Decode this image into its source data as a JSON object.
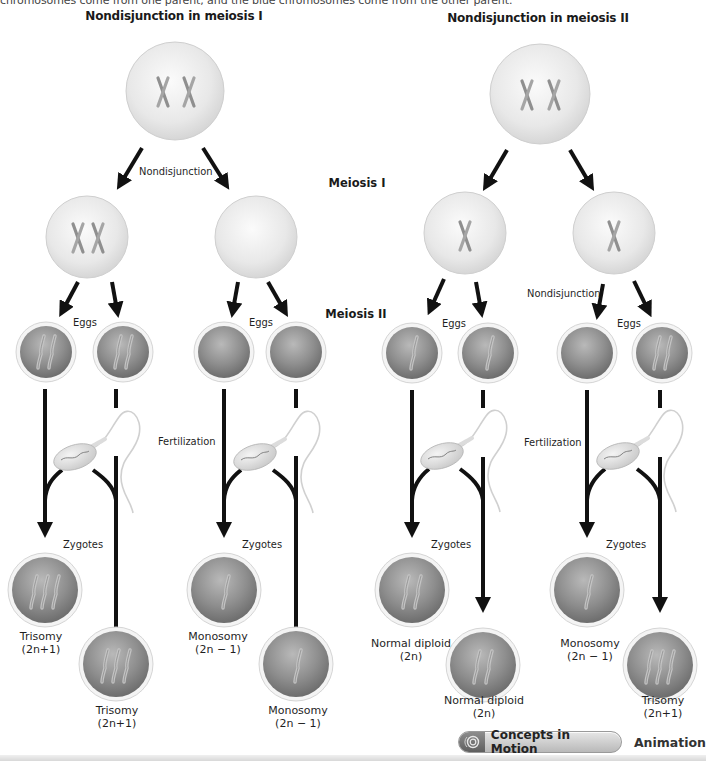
{
  "caption_fragment": "chromosomes come from one parent, and the blue chromosomes come from the other parent.",
  "panels": [
    {
      "title": "Nondisjunction in meiosis I",
      "nondisjunction_label": "Nondisjunction",
      "eggs_label": "Eggs",
      "fertilization_label": "Fertilization",
      "zygotes_label": "Zygotes",
      "results": [
        {
          "name": "Trisomy",
          "formula": "(2n+1)"
        },
        {
          "name": "Trisomy",
          "formula": "(2n+1)"
        },
        {
          "name": "Monosomy",
          "formula": "(2n − 1)"
        },
        {
          "name": "Monosomy",
          "formula": "(2n − 1)"
        }
      ]
    },
    {
      "title": "Nondisjunction in meiosis II",
      "nondisjunction_label": "Nondisjunction",
      "eggs_label": "Eggs",
      "fertilization_label": "Fertilization",
      "zygotes_label": "Zygotes",
      "results": [
        {
          "name": "Normal diploid",
          "formula": "(2n)"
        },
        {
          "name": "Normal diploid",
          "formula": "(2n)"
        },
        {
          "name": "Monosomy",
          "formula": "(2n − 1)"
        },
        {
          "name": "Trisomy",
          "formula": "(2n+1)"
        }
      ]
    }
  ],
  "stages": {
    "meiosis_1": "Meiosis I",
    "meiosis_2": "Meiosis II"
  },
  "footer": {
    "button_label": "Concepts in Motion",
    "button_icon": "ripple-icon",
    "after_label": "Animation"
  },
  "colors": {
    "arrow": "#111111",
    "cell_light": "#e9e9e9",
    "egg_dark": "#8a8a8a",
    "chromosome": "#9c9c9c"
  }
}
